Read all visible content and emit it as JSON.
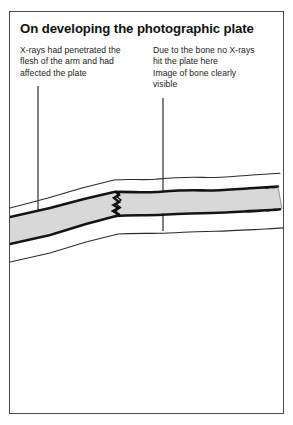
{
  "figure": {
    "title": "On developing the photographic plate",
    "background_color": "#ffffff",
    "border_color": "#4a4a4a"
  },
  "annotations": {
    "left": {
      "name": "x-ray-penetration-note",
      "lines": [
        "X-rays had penetrated the",
        "flesh of the arm and had",
        "affected the plate"
      ],
      "leader_line": {
        "x": 28,
        "y_start": 74,
        "y_end": 208
      }
    },
    "right": {
      "name": "bone-shadow-note",
      "lines": [
        "Due to the bone no X-rays",
        "hit the plate here",
        "Image of bone clearly",
        "visible"
      ],
      "leader_line": {
        "x": 153,
        "y_start": 86,
        "y_end": 218
      }
    }
  },
  "diagram": {
    "name": "arm-bone-cross-section",
    "bone_fill_color": "#d8d8d8",
    "outline_color": "#141414",
    "flesh_outline_color": "#2b2b2b",
    "break_line_color": "#101010",
    "elements": [
      "upper-flesh-outline",
      "bone-top-edge",
      "bone-body-fill",
      "bone-bottom-edge",
      "lower-flesh-outline",
      "bone-break-zigzag",
      "right-end-dashes"
    ]
  }
}
